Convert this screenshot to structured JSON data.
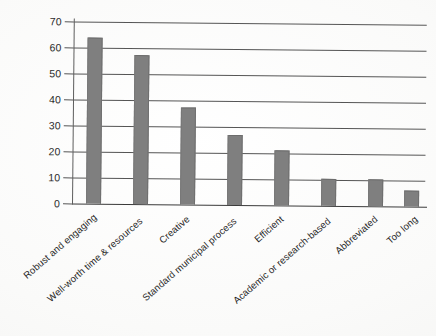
{
  "chart_data": {
    "type": "bar",
    "title": "",
    "subtitle": "",
    "xlabel": "",
    "ylabel": "",
    "categories": [
      "Robust and engaging",
      "Well-worth time & resources",
      "Creative",
      "Standard municipal process",
      "Efficient",
      "Academic or research-based",
      "Abbreviated",
      "Too long"
    ],
    "values": [
      64,
      57.5,
      37.5,
      27,
      21,
      10.5,
      10.5,
      6
    ],
    "series": [
      {
        "name": "Responses",
        "values": [
          64,
          57.5,
          37.5,
          27,
          21,
          10.5,
          10.5,
          6
        ]
      }
    ],
    "ylim": [
      0,
      70
    ],
    "ytick_labels": [
      "0",
      "10",
      "20",
      "30",
      "40",
      "50",
      "60",
      "70"
    ],
    "ytick_values": [
      0,
      10,
      20,
      30,
      40,
      50,
      60,
      70
    ],
    "grid": "horizontal",
    "legend": "none",
    "bar_color": "#7f7f7f",
    "gridline_color": "#555555",
    "axis_color": "#3a3a3a",
    "annotations": []
  },
  "axis": {
    "y_labels": {
      "t0": "0",
      "t10": "10",
      "t20": "20",
      "t30": "30",
      "t40": "40",
      "t50": "50",
      "t60": "60",
      "t70": "70"
    }
  },
  "x_labels": {
    "l0": "Robust and engaging",
    "l1": "Well-worth time & resources",
    "l2": "Creative",
    "l3": "Standard municipal process",
    "l4": "Efficient",
    "l5": "Academic or research-based",
    "l6": "Abbreviated",
    "l7": "Too long"
  }
}
